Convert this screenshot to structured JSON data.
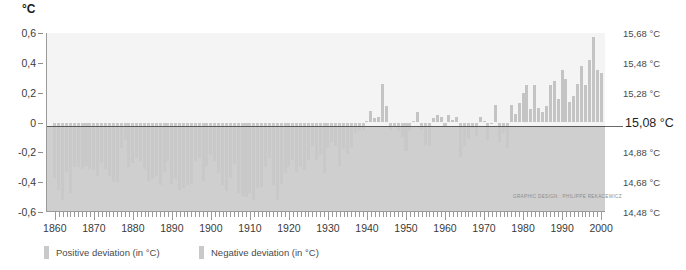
{
  "unit_header": "°C",
  "credit": "GRAPHIC DESIGN : PHILIPPE REKACEWICZ",
  "legend": {
    "positive": "Positive deviation (in °C)",
    "negative": "Negative deviation (in °C)"
  },
  "colors": {
    "bar_positive": "#c4c4c4",
    "bar_negative": "#c9c9c9",
    "plot_upper_bg": "#f4f4f4",
    "plot_lower_bg": "#cfcfcf",
    "zero_line": "#5a5a5a",
    "axis": "#9a9a9a",
    "text": "#3a3a3a"
  },
  "axis_left": {
    "labels": [
      "0,6",
      "0,4",
      "0,2",
      "0",
      "-0,2",
      "-0,4",
      "-0,6"
    ],
    "values": [
      0.6,
      0.4,
      0.2,
      0,
      -0.2,
      -0.4,
      -0.6
    ]
  },
  "axis_right": {
    "labels": [
      "15,68 °C",
      "15,48 °C",
      "15,28 °C",
      "15,08 °C",
      "14,88 °C",
      "14,68 °C",
      "14,48 °C"
    ],
    "values": [
      0.6,
      0.4,
      0.2,
      0,
      -0.2,
      -0.4,
      -0.6
    ],
    "emphasized_index": 3
  },
  "axis_bottom": {
    "labels": [
      "1860",
      "1870",
      "1880",
      "1890",
      "1900",
      "1910",
      "1920",
      "1930",
      "1940",
      "1950",
      "1960",
      "1970",
      "1980",
      "1990",
      "2000"
    ],
    "values": [
      1860,
      1870,
      1880,
      1890,
      1900,
      1910,
      1920,
      1930,
      1940,
      1950,
      1960,
      1970,
      1980,
      1990,
      2000
    ]
  },
  "chart_data": {
    "type": "bar",
    "title": "",
    "subtitle": "",
    "xlabel": "",
    "ylabel": "°C",
    "xlim": [
      1858,
      2001
    ],
    "ylim": [
      -0.6,
      0.6
    ],
    "grid": false,
    "legend_position": "bottom-left",
    "baseline_absolute_temperature_c": 15.08,
    "annotations": [
      "GRAPHIC DESIGN : PHILIPPE REKACEWICZ"
    ],
    "series": [
      {
        "name": "Temperature deviation (in °C)",
        "x": [
          1860,
          1861,
          1862,
          1863,
          1864,
          1865,
          1866,
          1867,
          1868,
          1869,
          1870,
          1871,
          1872,
          1873,
          1874,
          1875,
          1876,
          1877,
          1878,
          1879,
          1880,
          1881,
          1882,
          1883,
          1884,
          1885,
          1886,
          1887,
          1888,
          1889,
          1890,
          1891,
          1892,
          1893,
          1894,
          1895,
          1896,
          1897,
          1898,
          1899,
          1900,
          1901,
          1902,
          1903,
          1904,
          1905,
          1906,
          1907,
          1908,
          1909,
          1910,
          1911,
          1912,
          1913,
          1914,
          1915,
          1916,
          1917,
          1918,
          1919,
          1920,
          1921,
          1922,
          1923,
          1924,
          1925,
          1926,
          1927,
          1928,
          1929,
          1930,
          1931,
          1932,
          1933,
          1934,
          1935,
          1936,
          1937,
          1938,
          1939,
          1940,
          1941,
          1942,
          1943,
          1944,
          1945,
          1946,
          1947,
          1948,
          1949,
          1950,
          1951,
          1952,
          1953,
          1954,
          1955,
          1956,
          1957,
          1958,
          1959,
          1960,
          1961,
          1962,
          1963,
          1964,
          1965,
          1966,
          1967,
          1968,
          1969,
          1970,
          1971,
          1972,
          1973,
          1974,
          1975,
          1976,
          1977,
          1978,
          1979,
          1980,
          1981,
          1982,
          1983,
          1984,
          1985,
          1986,
          1987,
          1988,
          1989,
          1990,
          1991,
          1992,
          1993,
          1994,
          1995,
          1996,
          1997,
          1998,
          1999,
          2000
        ],
        "values": [
          -0.37,
          -0.45,
          -0.52,
          -0.33,
          -0.47,
          -0.3,
          -0.3,
          -0.31,
          -0.29,
          -0.31,
          -0.32,
          -0.36,
          -0.27,
          -0.31,
          -0.36,
          -0.4,
          -0.4,
          -0.17,
          -0.12,
          -0.3,
          -0.27,
          -0.24,
          -0.26,
          -0.31,
          -0.39,
          -0.38,
          -0.36,
          -0.42,
          -0.33,
          -0.26,
          -0.41,
          -0.38,
          -0.45,
          -0.44,
          -0.42,
          -0.41,
          -0.26,
          -0.24,
          -0.39,
          -0.29,
          -0.22,
          -0.26,
          -0.34,
          -0.42,
          -0.46,
          -0.37,
          -0.28,
          -0.47,
          -0.49,
          -0.5,
          -0.47,
          -0.52,
          -0.44,
          -0.43,
          -0.3,
          -0.24,
          -0.42,
          -0.52,
          -0.41,
          -0.34,
          -0.3,
          -0.25,
          -0.33,
          -0.3,
          -0.32,
          -0.25,
          -0.16,
          -0.25,
          -0.22,
          -0.34,
          -0.17,
          -0.13,
          -0.16,
          -0.29,
          -0.18,
          -0.21,
          -0.17,
          -0.07,
          -0.06,
          -0.05,
          0.01,
          0.08,
          0.03,
          0.04,
          0.26,
          0.11,
          -0.05,
          -0.03,
          -0.06,
          -0.1,
          -0.19,
          -0.06,
          0.01,
          0.07,
          -0.05,
          -0.15,
          -0.16,
          0.03,
          0.05,
          0.04,
          -0.03,
          0.05,
          0.02,
          0.04,
          -0.23,
          -0.16,
          -0.11,
          -0.04,
          -0.09,
          0.04,
          0.01,
          -0.12,
          0.0,
          0.12,
          -0.13,
          -0.07,
          -0.17,
          0.12,
          0.06,
          0.13,
          0.2,
          0.25,
          0.09,
          0.25,
          0.1,
          0.07,
          0.11,
          0.25,
          0.28,
          0.16,
          0.35,
          0.29,
          0.14,
          0.18,
          0.26,
          0.38,
          0.25,
          0.42,
          0.57,
          0.35,
          0.33
        ]
      }
    ]
  }
}
